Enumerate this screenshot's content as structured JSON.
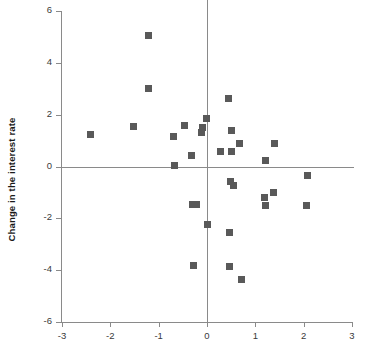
{
  "chart_data": {
    "type": "scatter",
    "title": "",
    "xlabel": "",
    "ylabel": "Change in the interest rate",
    "xlim": [
      -3,
      3
    ],
    "ylim": [
      -6,
      6
    ],
    "grid": false,
    "legend": null,
    "xticks": [
      "-3",
      "-2",
      "-1",
      "0",
      "1",
      "2",
      "3"
    ],
    "xtick_values": [
      -3,
      -2,
      -1,
      0,
      1,
      2,
      3
    ],
    "yticks": [
      "6",
      "4",
      "2",
      "0",
      "-2",
      "-4",
      "-6"
    ],
    "ytick_values": [
      6,
      4,
      2,
      0,
      -2,
      -4,
      -6
    ],
    "marker": "square",
    "marker_color": "#595959",
    "axis_color": "#8a8a8a",
    "points": [
      {
        "x": -1.21,
        "y": 5.05
      },
      {
        "x": -1.21,
        "y": 3.0
      },
      {
        "x": -2.42,
        "y": 1.25
      },
      {
        "x": -1.52,
        "y": 1.55
      },
      {
        "x": -0.7,
        "y": 1.15
      },
      {
        "x": -0.46,
        "y": 1.6
      },
      {
        "x": -0.32,
        "y": 0.42
      },
      {
        "x": -0.67,
        "y": 0.03
      },
      {
        "x": -0.12,
        "y": 1.32
      },
      {
        "x": -0.1,
        "y": 1.5
      },
      {
        "x": -0.02,
        "y": 1.85
      },
      {
        "x": 0.45,
        "y": 2.62
      },
      {
        "x": 0.5,
        "y": 1.38
      },
      {
        "x": 0.27,
        "y": 0.57
      },
      {
        "x": 0.5,
        "y": 0.58
      },
      {
        "x": 0.68,
        "y": 0.88
      },
      {
        "x": 1.4,
        "y": 0.9
      },
      {
        "x": 1.2,
        "y": 0.24
      },
      {
        "x": 2.08,
        "y": -0.34
      },
      {
        "x": 0.48,
        "y": -0.58
      },
      {
        "x": 0.55,
        "y": -0.72
      },
      {
        "x": 1.38,
        "y": -1.0
      },
      {
        "x": 1.18,
        "y": -1.18
      },
      {
        "x": 1.22,
        "y": -1.5
      },
      {
        "x": 2.05,
        "y": -1.5
      },
      {
        "x": -0.3,
        "y": -1.45
      },
      {
        "x": -0.22,
        "y": -1.48
      },
      {
        "x": 0.0,
        "y": -2.22
      },
      {
        "x": 0.47,
        "y": -2.55
      },
      {
        "x": -0.27,
        "y": -3.83
      },
      {
        "x": 0.47,
        "y": -3.85
      },
      {
        "x": 0.72,
        "y": -4.35
      }
    ]
  }
}
